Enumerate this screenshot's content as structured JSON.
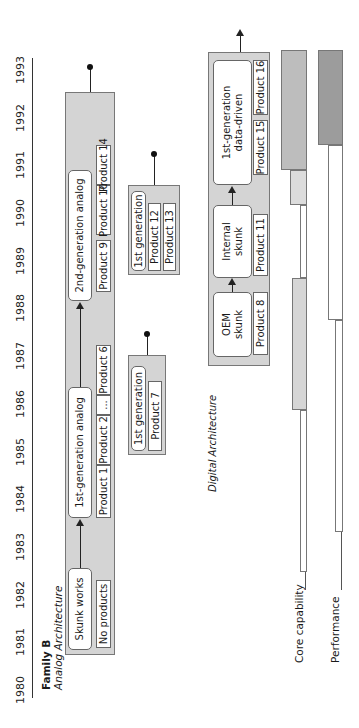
{
  "timeline": {
    "years": [
      "1980",
      "1981",
      "1982",
      "1983",
      "1984",
      "1985",
      "1986",
      "1987",
      "1988",
      "1989",
      "1990",
      "1991",
      "1992",
      "1993"
    ]
  },
  "family": {
    "title": "Family B",
    "subtitle": "Analog Architecture"
  },
  "analog": {
    "stages": [
      {
        "label": "Skunk works"
      },
      {
        "label": "1st-generation analog"
      },
      {
        "label": "2nd-generation analog"
      }
    ],
    "products": [
      "No products",
      "Product 1",
      "Product 2",
      "...",
      "Product 6",
      "Product 9",
      "Product 10",
      "Product 14"
    ]
  },
  "oem": {
    "label": "OEM Initiatives",
    "groups": [
      {
        "stage": "1st generation",
        "products": [
          "Product 7"
        ]
      },
      {
        "stage": "1st generation",
        "products": [
          "Product 12",
          "Product 13"
        ]
      }
    ]
  },
  "digital": {
    "label": "Digital Architecture",
    "stages": [
      {
        "line1": "OEM",
        "line2": "skunk"
      },
      {
        "line1": "Internal",
        "line2": "skunk"
      },
      {
        "line1": "1st-generation",
        "line2": "data-driven"
      }
    ],
    "products": [
      "Product 8",
      "Product 11",
      "Product 15",
      "Product 16"
    ]
  },
  "metrics": {
    "core_label": "Core capability",
    "performance_label": "Performance"
  },
  "colors": {
    "group_fill": "#d4d4d4",
    "bar_light": "#dcdcdc",
    "bar_mid": "#bdbdbd",
    "bar_dark": "#9c9c9c"
  }
}
